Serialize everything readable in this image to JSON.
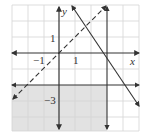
{
  "graph": {
    "labels": {
      "y_axis": "y",
      "x_axis": "x",
      "y_tick_1": "1",
      "x_tick_neg1": "−1",
      "x_tick_1": "1",
      "y_tick_neg3": "−3"
    },
    "colors": {
      "grid": "#d4d4d4",
      "shade": "#e2e2e2",
      "line": "#333333"
    },
    "boundaries": [
      {
        "equation": "y = x",
        "style": "dashed"
      },
      {
        "equation": "y = -3/2 x + 4",
        "style": "solid"
      },
      {
        "equation": "x = 3",
        "style": "solid"
      },
      {
        "equation": "y = -2",
        "style": "solid"
      }
    ],
    "shaded_region": "x < 3 and y < -2"
  }
}
